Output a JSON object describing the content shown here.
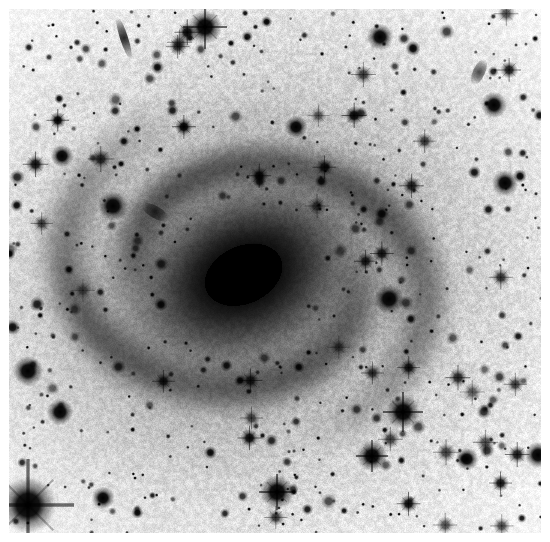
{
  "image": {
    "kind": "astronomical-plate",
    "rendering": "inverted-grayscale-negative",
    "width": 550,
    "height": 542,
    "caption": "",
    "background_color": "#ffffff",
    "ink_color": "#000000",
    "margin_px": 9,
    "field": {
      "x": 9,
      "y": 9,
      "width": 532,
      "height": 524,
      "sky_level": 0.12,
      "grain_amplitude": 0.16,
      "grain_scale_px": 1.6
    }
  },
  "galaxy": {
    "name": "",
    "type": "barred-spiral",
    "center_x": 243,
    "center_y": 274,
    "core": {
      "label": "saturated-bulge-bar",
      "cx": 243,
      "cy": 274,
      "semi_major": 86,
      "semi_minor": 60,
      "angle_deg": -25,
      "peak_opacity": 1.0,
      "falloff": 2.4
    },
    "inner_disk": {
      "label": "inner-disk",
      "cx": 243,
      "cy": 276,
      "semi_major": 140,
      "semi_minor": 108,
      "angle_deg": -22,
      "peak_opacity": 0.62,
      "falloff": 1.7
    },
    "halo": {
      "label": "outer-halo",
      "cx": 248,
      "cy": 280,
      "semi_major": 245,
      "semi_minor": 205,
      "angle_deg": -18,
      "peak_opacity": 0.3,
      "falloff": 1.25
    },
    "arms": [
      {
        "label": "arm-north-ring",
        "cx": 243,
        "cy": 274,
        "r_start": 108,
        "r_end": 165,
        "theta_start_deg": 175,
        "theta_end_deg": 355,
        "width": 30,
        "opacity": 0.27
      },
      {
        "label": "arm-south-ring",
        "cx": 243,
        "cy": 274,
        "r_start": 112,
        "r_end": 172,
        "theta_start_deg": 355,
        "theta_end_deg": 540,
        "width": 32,
        "opacity": 0.24
      },
      {
        "label": "arm-east-outer",
        "cx": 243,
        "cy": 274,
        "r_start": 150,
        "r_end": 215,
        "theta_start_deg": 300,
        "theta_end_deg": 430,
        "width": 34,
        "opacity": 0.15
      },
      {
        "label": "arm-west-outer",
        "cx": 243,
        "cy": 274,
        "r_start": 150,
        "r_end": 210,
        "theta_start_deg": 120,
        "theta_end_deg": 250,
        "width": 34,
        "opacity": 0.14
      }
    ]
  },
  "stars": {
    "count_note": "foreground stars rendered as dark points on inverted plate",
    "bright": [
      {
        "name": "star-lower-left-spiked",
        "x": 28,
        "y": 505,
        "r": 15,
        "spikes": true,
        "spike_len": 46,
        "opacity": 1.0
      },
      {
        "name": "star-top-center-spiked",
        "x": 205,
        "y": 27,
        "r": 9,
        "spikes": true,
        "spike_len": 22,
        "opacity": 1.0
      },
      {
        "name": "star-lower-right-a",
        "x": 403,
        "y": 412,
        "r": 9,
        "spikes": true,
        "spike_len": 20,
        "opacity": 1.0
      },
      {
        "name": "star-lower-center",
        "x": 277,
        "y": 492,
        "r": 9,
        "spikes": true,
        "spike_len": 18,
        "opacity": 1.0
      },
      {
        "name": "star-lower-right-b",
        "x": 372,
        "y": 456,
        "r": 8,
        "spikes": true,
        "spike_len": 16,
        "opacity": 1.0
      },
      {
        "name": "star-right-mid",
        "x": 389,
        "y": 299,
        "r": 8,
        "spikes": false,
        "spike_len": 0,
        "opacity": 1.0
      },
      {
        "name": "star-left-mid",
        "x": 113,
        "y": 206,
        "r": 8,
        "spikes": false,
        "spike_len": 0,
        "opacity": 1.0
      },
      {
        "name": "star-left-low",
        "x": 28,
        "y": 371,
        "r": 8,
        "spikes": false,
        "spike_len": 0,
        "opacity": 1.0
      },
      {
        "name": "star-upper-right",
        "x": 380,
        "y": 37,
        "r": 7,
        "spikes": false,
        "spike_len": 0,
        "opacity": 1.0
      },
      {
        "name": "star-upper-right-b",
        "x": 494,
        "y": 105,
        "r": 7,
        "spikes": false,
        "spike_len": 0,
        "opacity": 1.0
      },
      {
        "name": "star-far-right",
        "x": 505,
        "y": 183,
        "r": 7,
        "spikes": false,
        "spike_len": 0,
        "opacity": 1.0
      },
      {
        "name": "star-left-upper",
        "x": 62,
        "y": 156,
        "r": 6,
        "spikes": false,
        "spike_len": 0,
        "opacity": 1.0
      },
      {
        "name": "star-center-right",
        "x": 296,
        "y": 127,
        "r": 6,
        "spikes": false,
        "spike_len": 0,
        "opacity": 1.0
      },
      {
        "name": "star-bottom-left",
        "x": 60,
        "y": 412,
        "r": 7,
        "spikes": false,
        "spike_len": 0,
        "opacity": 1.0
      },
      {
        "name": "star-bottom-mid",
        "x": 103,
        "y": 498,
        "r": 6,
        "spikes": false,
        "spike_len": 0,
        "opacity": 1.0
      },
      {
        "name": "star-right-low",
        "x": 467,
        "y": 459,
        "r": 6,
        "spikes": false,
        "spike_len": 0,
        "opacity": 1.0
      },
      {
        "name": "star-right-lower-edge",
        "x": 538,
        "y": 455,
        "r": 7,
        "spikes": false,
        "spike_len": 0,
        "opacity": 1.0
      }
    ],
    "field_seed": 20240517,
    "field_count": 560,
    "field_radius_min": 1.0,
    "field_radius_max": 5.0
  },
  "galaxies_background": [
    {
      "name": "edge-on-streak-top-left",
      "x": 124,
      "y": 38,
      "len": 22,
      "thick": 4,
      "angle_deg": 72,
      "opacity": 0.85
    },
    {
      "name": "smudge-left-mid",
      "x": 155,
      "y": 212,
      "len": 16,
      "thick": 6,
      "angle_deg": 30,
      "opacity": 0.7
    },
    {
      "name": "smudge-upper-right",
      "x": 479,
      "y": 72,
      "len": 14,
      "thick": 6,
      "angle_deg": 115,
      "opacity": 0.7
    }
  ]
}
